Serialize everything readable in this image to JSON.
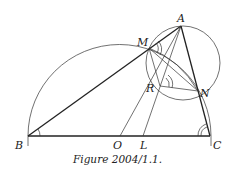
{
  "figure": {
    "caption": "Figure 2004/1.1.",
    "points": {
      "A": {
        "label": "A",
        "x": 181,
        "y": 26
      },
      "M": {
        "label": "M",
        "x": 149,
        "y": 48
      },
      "R": {
        "label": "R",
        "x": 160,
        "y": 86
      },
      "N": {
        "label": "N",
        "x": 198,
        "y": 91
      },
      "B": {
        "label": "B",
        "x": 28,
        "y": 136
      },
      "C": {
        "label": "C",
        "x": 210,
        "y": 136
      },
      "O": {
        "label": "O",
        "x": 120,
        "y": 136
      },
      "L": {
        "label": "L",
        "x": 143,
        "y": 136
      }
    },
    "circles": [
      {
        "name": "semicircle-BC",
        "center": "O",
        "radius": 91
      },
      {
        "name": "circle-AMRN",
        "cx": 183,
        "cy": 63,
        "radius": 37
      }
    ],
    "segments": [
      "AB",
      "AC",
      "BC",
      "AL",
      "AR",
      "OR",
      "MN",
      "MR",
      "RN",
      "MC"
    ],
    "angle_marks": [
      "B",
      "C",
      "M",
      "R"
    ],
    "stroke_color": "#222222"
  }
}
